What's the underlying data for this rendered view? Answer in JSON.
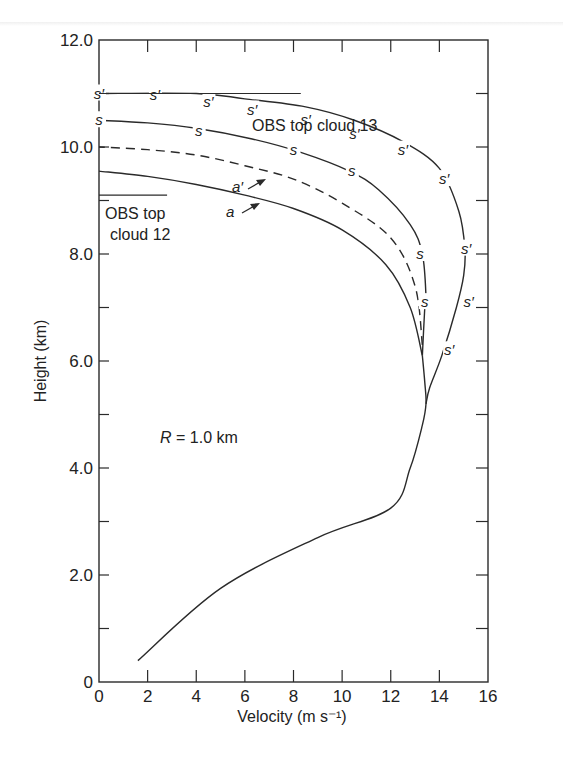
{
  "chart_data": {
    "type": "line",
    "title": "",
    "xlabel": "Velocity (m s⁻¹)",
    "ylabel": "Height (km)",
    "xlim": [
      0,
      16
    ],
    "ylim": [
      0,
      12
    ],
    "x_ticks": [
      "0",
      "2",
      "4",
      "6",
      "8",
      "10",
      "12",
      "14",
      "16"
    ],
    "y_ticks": [
      "0",
      "2.0",
      "4.0",
      "6.0",
      "8.0",
      "10.0",
      "12.0"
    ],
    "grid": false,
    "annotations": {
      "param": "R = 1.0 km",
      "obs_top_cloud_13": "OBS top cloud 13",
      "obs_top_cloud_12_line1": "OBS top",
      "obs_top_cloud_12_line2": "cloud 12",
      "label_a": "a",
      "label_a_prime": "a′",
      "marker_s": "s",
      "marker_s_prime": "s′"
    },
    "obs_levels": [
      {
        "name": "OBS top cloud 13",
        "height": 11.0,
        "x_range": [
          0,
          8.3
        ]
      },
      {
        "name": "OBS top cloud 12",
        "height": 9.1,
        "x_range": [
          0,
          2.8
        ]
      }
    ],
    "series": [
      {
        "name": "a (common lower)",
        "style": "solid",
        "points": [
          [
            1.6,
            0.4
          ],
          [
            5,
            1.75
          ],
          [
            9,
            2.7
          ],
          [
            12.0,
            3.25
          ],
          [
            12.8,
            4.0
          ],
          [
            13.3,
            4.8
          ],
          [
            13.45,
            5.2
          ],
          [
            13.4,
            5.6
          ],
          [
            13.3,
            6.1
          ]
        ]
      },
      {
        "name": "a",
        "style": "solid",
        "points": [
          [
            13.3,
            6.1
          ],
          [
            12.8,
            7.0
          ],
          [
            11.8,
            7.8
          ],
          [
            10.0,
            8.45
          ],
          [
            8.0,
            8.85
          ],
          [
            6.0,
            9.1
          ],
          [
            4.0,
            9.3
          ],
          [
            2.0,
            9.45
          ],
          [
            0,
            9.55
          ]
        ]
      },
      {
        "name": "a′",
        "style": "dashed",
        "points": [
          [
            13.3,
            6.3
          ],
          [
            13.0,
            7.4
          ],
          [
            12.0,
            8.3
          ],
          [
            10.0,
            8.95
          ],
          [
            8.0,
            9.4
          ],
          [
            6.0,
            9.65
          ],
          [
            4.0,
            9.85
          ],
          [
            2.0,
            9.95
          ],
          [
            0,
            10.0
          ]
        ]
      },
      {
        "name": "s",
        "style": "solid-with-s-markers",
        "points": [
          [
            13.3,
            6.1
          ],
          [
            13.4,
            7.0
          ],
          [
            13.45,
            7.2
          ],
          [
            13.3,
            8.0
          ],
          [
            12.8,
            8.55
          ],
          [
            11.5,
            9.2
          ],
          [
            10.3,
            9.55
          ],
          [
            8.3,
            9.9
          ],
          [
            6.3,
            10.15
          ],
          [
            4.0,
            10.35
          ],
          [
            2.0,
            10.45
          ],
          [
            0,
            10.5
          ]
        ],
        "marker_positions": [
          [
            0,
            10.5
          ],
          [
            4.1,
            10.3
          ],
          [
            8.0,
            9.95
          ],
          [
            10.4,
            9.55
          ],
          [
            13.2,
            8.0
          ],
          [
            13.4,
            7.1
          ]
        ]
      },
      {
        "name": "s′",
        "style": "solid-with-s′-markers",
        "points": [
          [
            13.45,
            5.2
          ],
          [
            13.6,
            5.5
          ],
          [
            14.1,
            6.1
          ],
          [
            14.7,
            7.0
          ],
          [
            15.0,
            7.6
          ],
          [
            15.05,
            8.1
          ],
          [
            14.8,
            8.8
          ],
          [
            14.0,
            9.6
          ],
          [
            12.5,
            10.1
          ],
          [
            10.5,
            10.5
          ],
          [
            8.5,
            10.75
          ],
          [
            6.0,
            10.9
          ],
          [
            4.0,
            11.0
          ],
          [
            0,
            11.0
          ]
        ],
        "marker_positions": [
          [
            0,
            11.0
          ],
          [
            2.3,
            10.98
          ],
          [
            4.5,
            10.85
          ],
          [
            6.3,
            10.7
          ],
          [
            8.5,
            10.5
          ],
          [
            10.5,
            10.25
          ],
          [
            12.5,
            9.95
          ],
          [
            14.2,
            9.4
          ],
          [
            15.1,
            8.1
          ],
          [
            15.2,
            7.1
          ],
          [
            14.4,
            6.2
          ]
        ]
      }
    ]
  }
}
